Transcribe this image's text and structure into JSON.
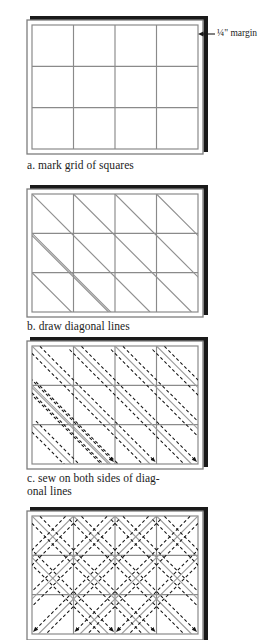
{
  "figure": {
    "panel_count": 4
  },
  "colors": {
    "page_background": "#ffffff",
    "fabric_fill": "#ffffff",
    "grid_line": "#8a8a8a",
    "edge_line": "#7d7d7d",
    "shadow_border": "#1a1a1a",
    "diagonal_line": "#8f8f8f",
    "stitch_line": "#141414",
    "caption_text": "#1c1c1c"
  },
  "grid": {
    "columns": 4,
    "rows": 3,
    "margin_label": "¼\" margin"
  },
  "panels": [
    {
      "key": "a",
      "letter": "a.",
      "caption": "a. mark grid of squares",
      "description": "blank grid of squares with seam margin",
      "has_diagonals": false,
      "has_stitches": false,
      "diagonal_directions": [],
      "annotation": "¼\" margin"
    },
    {
      "key": "b",
      "letter": "b.",
      "caption": "b. draw diagonal lines",
      "description": "grid with single-direction diagonal lines",
      "has_diagonals": true,
      "has_stitches": false,
      "diagonal_directions": [
        "down-right"
      ],
      "annotation": ""
    },
    {
      "key": "c",
      "letter": "c.",
      "caption": "c. sew on both sides of diag-\nonal lines",
      "description": "dashed stitching lines with arrows on both sides of each diagonal",
      "has_diagonals": true,
      "has_stitches": true,
      "diagonal_directions": [
        "down-right"
      ],
      "annotation": ""
    },
    {
      "key": "d",
      "letter": "d.",
      "caption": "",
      "description": "diagonals stitched in both directions forming diamonds",
      "has_diagonals": true,
      "has_stitches": true,
      "diagonal_directions": [
        "down-right",
        "up-right"
      ],
      "annotation": ""
    }
  ]
}
